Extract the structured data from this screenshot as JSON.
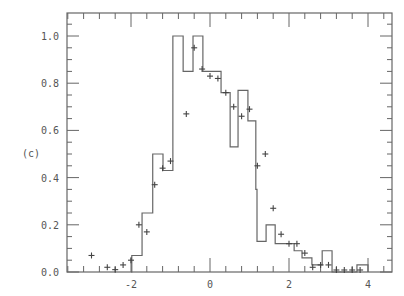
{
  "panel_label": "(c)",
  "header_fragment": "",
  "chart_data": {
    "type": "histogram+scatter",
    "title": "",
    "xlabel": "",
    "ylabel": "",
    "xlim": [
      -3.6,
      4.6
    ],
    "ylim": [
      0.0,
      1.1
    ],
    "grid": false,
    "x_ticks": [
      -2,
      0,
      2,
      4
    ],
    "x_tick_labels": [
      "-2",
      "0",
      "2",
      "4"
    ],
    "y_ticks": [
      0.0,
      0.2,
      0.4,
      0.6,
      0.8,
      1.0
    ],
    "y_tick_labels": [
      "0.0",
      "0.2",
      "0.4",
      "0.6",
      "0.8",
      "1.0"
    ],
    "series": [
      {
        "name": "histogram",
        "style": "step",
        "edges": [
          -2.0,
          -1.98,
          -1.72,
          -1.45,
          -1.19,
          -0.94,
          -0.68,
          -0.43,
          -0.18,
          0.28,
          0.51,
          0.71,
          0.96,
          1.16,
          1.19,
          1.42,
          1.65,
          2.13,
          2.33,
          2.58,
          2.84,
          3.09,
          3.72,
          4.0
        ],
        "values": [
          0.0,
          0.07,
          0.25,
          0.5,
          0.43,
          1.0,
          0.85,
          1.0,
          0.85,
          0.76,
          0.53,
          0.77,
          0.64,
          0.35,
          0.13,
          0.2,
          0.12,
          0.09,
          0.06,
          0.03,
          0.09,
          0.0,
          0.03
        ]
      },
      {
        "name": "data points",
        "style": "plus-markers",
        "x": [
          -3.0,
          -2.6,
          -2.4,
          -2.2,
          -2.0,
          -1.8,
          -1.6,
          -1.4,
          -1.2,
          -1.0,
          -0.6,
          -0.4,
          -0.2,
          0.0,
          0.2,
          0.4,
          0.6,
          0.8,
          1.0,
          1.2,
          1.4,
          1.6,
          1.8,
          2.0,
          2.2,
          2.4,
          2.6,
          2.8,
          3.0,
          3.2,
          3.4,
          3.6,
          3.8
        ],
        "y": [
          0.07,
          0.02,
          0.01,
          0.03,
          0.05,
          0.2,
          0.17,
          0.37,
          0.44,
          0.47,
          0.67,
          0.95,
          0.86,
          0.83,
          0.82,
          0.76,
          0.7,
          0.66,
          0.69,
          0.45,
          0.5,
          0.27,
          0.16,
          0.12,
          0.12,
          0.08,
          0.02,
          0.03,
          0.03,
          0.0,
          0.0,
          0.0,
          0.0
        ]
      }
    ]
  }
}
